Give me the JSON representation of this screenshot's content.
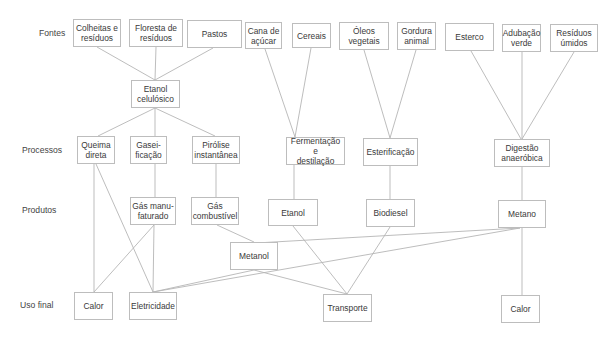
{
  "row_labels": {
    "sources": "Fontes",
    "processes": "Processos",
    "products": "Produtos",
    "end_use": "Uso final"
  },
  "nodes": {
    "colheitas": "Colheitas e\nresíduos",
    "floresta": "Floresta de\nresíduos",
    "pastos": "Pastos",
    "cana": "Cana de\naçúcar",
    "cereais": "Cereais",
    "oleos": "Óleos\nvegetais",
    "gordura": "Gordura\nanimal",
    "esterco": "Esterco",
    "adubacao": "Adubação\nverde",
    "residuos_umidos": "Resíduos\númidos",
    "etanol_celulosico": "Etanol\ncelulósico",
    "queima": "Queima\ndireta",
    "gaseificacao": "Gasei-\nficação",
    "pirolise": "Pirólise\ninstantânea",
    "fermentacao": "Fermentação e\ndestilação",
    "esterificacao": "Esterificação",
    "digestao": "Digestão\nanaeróbica",
    "gas_manufaturado": "Gás manu-\nfaturado",
    "gas_combustivel": "Gás\ncombustível",
    "etanol": "Etanol",
    "biodiesel": "Biodiesel",
    "metano": "Metano",
    "metanol": "Metanol",
    "calor_1": "Calor",
    "eletricidade": "Eletricidade",
    "transporte": "Transporte",
    "calor_2": "Calor"
  },
  "edges": [
    [
      "colheitas",
      "etanol_celulosico"
    ],
    [
      "floresta",
      "etanol_celulosico"
    ],
    [
      "pastos",
      "etanol_celulosico"
    ],
    [
      "etanol_celulosico",
      "queima"
    ],
    [
      "etanol_celulosico",
      "gaseificacao"
    ],
    [
      "etanol_celulosico",
      "pirolise"
    ],
    [
      "cana",
      "fermentacao"
    ],
    [
      "cereais",
      "fermentacao"
    ],
    [
      "oleos",
      "esterificacao"
    ],
    [
      "gordura",
      "esterificacao"
    ],
    [
      "esterco",
      "digestao"
    ],
    [
      "adubacao",
      "digestao"
    ],
    [
      "residuos_umidos",
      "digestao"
    ],
    [
      "gaseificacao",
      "gas_manufaturado"
    ],
    [
      "pirolise",
      "gas_combustivel"
    ],
    [
      "fermentacao",
      "etanol"
    ],
    [
      "esterificacao",
      "biodiesel"
    ],
    [
      "digestao",
      "metano"
    ],
    [
      "queima",
      "calor_1"
    ],
    [
      "queima",
      "eletricidade"
    ],
    [
      "gas_manufaturado",
      "calor_1"
    ],
    [
      "gas_manufaturado",
      "eletricidade"
    ],
    [
      "gas_combustivel",
      "metanol"
    ],
    [
      "metano",
      "metanol"
    ],
    [
      "metano",
      "eletricidade"
    ],
    [
      "metano",
      "calor_2"
    ],
    [
      "metanol",
      "eletricidade"
    ],
    [
      "metanol",
      "transporte"
    ],
    [
      "etanol",
      "transporte"
    ],
    [
      "biodiesel",
      "transporte"
    ]
  ]
}
